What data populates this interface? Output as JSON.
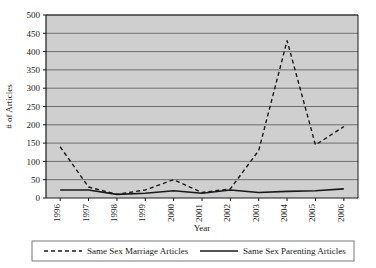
{
  "chart_data": {
    "type": "line",
    "title": "",
    "xlabel": "Year",
    "ylabel": "# of Articles",
    "categories": [
      "1996",
      "1997",
      "1998",
      "1999",
      "2000",
      "2001",
      "2002",
      "2003",
      "2004",
      "2005",
      "2006"
    ],
    "x": [
      1996,
      1997,
      1998,
      1999,
      2000,
      2001,
      2002,
      2003,
      2004,
      2005,
      2006
    ],
    "series": [
      {
        "name": "Same Sex Marriage Articles",
        "style": "dashed",
        "color": "#1a1a1a",
        "values": [
          140,
          30,
          10,
          22,
          50,
          15,
          25,
          130,
          430,
          145,
          195
        ]
      },
      {
        "name": "Same Sex Parenting Articles",
        "style": "solid",
        "color": "#1a1a1a",
        "values": [
          22,
          22,
          10,
          13,
          20,
          13,
          22,
          15,
          18,
          20,
          25
        ]
      }
    ],
    "ylim": [
      0,
      500
    ],
    "ytick_step": 50,
    "yticks": [
      0,
      50,
      100,
      150,
      200,
      250,
      300,
      350,
      400,
      450,
      500
    ],
    "grid": "horizontal",
    "legend_position": "bottom",
    "plot_background": "#cfcfcf",
    "gridline_color": "#6e6e6e",
    "axis_color": "#1a1a1a"
  },
  "legend": {
    "items": [
      {
        "label": "Same Sex Marriage Articles",
        "style": "dashed"
      },
      {
        "label": "Same Sex Parenting Articles",
        "style": "solid"
      }
    ]
  }
}
